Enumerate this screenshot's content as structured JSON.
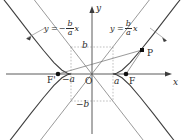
{
  "figure": {
    "axis_labels": {
      "x": "x",
      "y": "y",
      "origin": "O"
    },
    "point_labels": {
      "focus_left": "F'",
      "focus_right": "F",
      "point_p": "P"
    },
    "tick_labels": {
      "a_pos": "a",
      "a_neg": "−a",
      "b_pos": "b",
      "b_neg": "−b"
    },
    "asymptote_left": {
      "lhs": "y =",
      "sign": "−",
      "numerator": "b",
      "denominator": "a",
      "variable": "x"
    },
    "asymptote_right": {
      "lhs": "y =",
      "sign": "",
      "numerator": "b",
      "denominator": "a",
      "variable": "x"
    },
    "colors": {
      "curve": "#4a4a4a",
      "axis": "#555555",
      "dashed": "#9a9a9a",
      "text": "#2b2b2b",
      "marker": "#111111",
      "background": "#ffffff"
    },
    "geometry": {
      "origin_x": 92,
      "origin_y": 74,
      "a": 21,
      "b": 27,
      "c": 34,
      "p_x": 142,
      "p_y": 50
    }
  }
}
